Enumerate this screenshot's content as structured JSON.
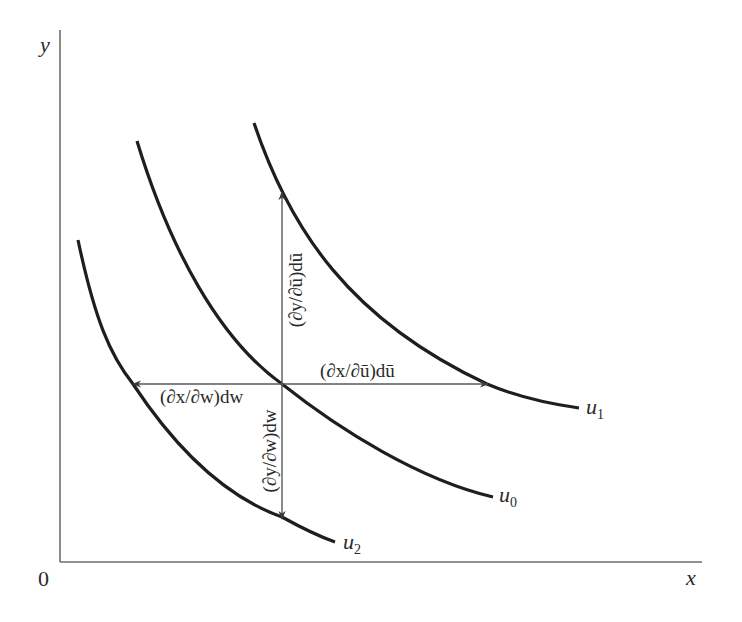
{
  "figure": {
    "axes": {
      "x_label": "x",
      "y_label": "y",
      "origin_label": "0"
    },
    "curves": [
      {
        "id": "u1",
        "label_base": "u",
        "label_sub": "1"
      },
      {
        "id": "u0",
        "label_base": "u",
        "label_sub": "0"
      },
      {
        "id": "u2",
        "label_base": "u",
        "label_sub": "2"
      }
    ],
    "arrows": {
      "up": {
        "label": "(∂y/∂ū)dū",
        "direction": "up",
        "target_curve": "u1"
      },
      "right": {
        "label": "(∂x/∂ū)dū",
        "direction": "right",
        "target_curve": "u1"
      },
      "left": {
        "label": "(∂x/∂w)dw",
        "direction": "left",
        "target_curve": "u2"
      },
      "down": {
        "label": "(∂y/∂w)dw",
        "direction": "down",
        "target_curve": "u2"
      }
    },
    "colors": {
      "curve": "#1e1e1e",
      "axis": "#6e6e6e",
      "arrow": "#5a5a5a",
      "text": "#2a2a2a",
      "background": "#ffffff"
    }
  }
}
